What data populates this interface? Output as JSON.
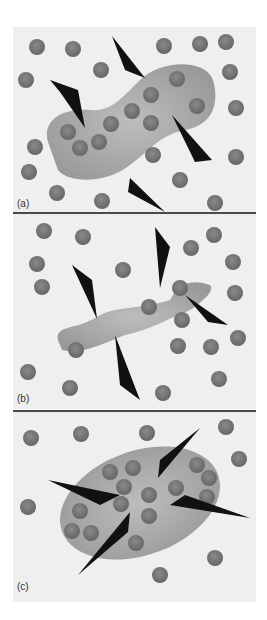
{
  "figure": {
    "panels": [
      {
        "label": "(a)",
        "description": "dumbbell-shaped droplet containing particles with arrows pointing in and out"
      },
      {
        "label": "(b)",
        "description": "elongated irregular filament with arrows pointing outward"
      },
      {
        "label": "(c)",
        "description": "elliptical droplet with arrows pointing inward"
      }
    ]
  },
  "colors": {
    "background": "#efefef",
    "particle": "#7a7a7a",
    "blob": "#a3a3a3",
    "arrow": "#111111",
    "divider": "#4a4a4a"
  }
}
